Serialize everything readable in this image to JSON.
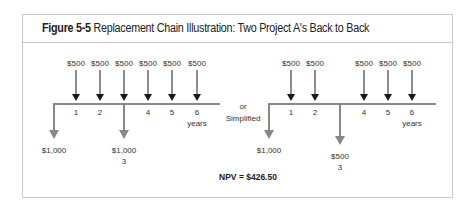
{
  "figure": {
    "label": "Figure 5-5",
    "title": "Replacement Chain Illustration: Two Project A's Back to Back"
  },
  "colors": {
    "inflow_arrow": "#1a1a1a",
    "outflow_arrow": "#888888",
    "timeline": "#888888",
    "border": "#c8c8c8"
  },
  "connector": {
    "line1": "or",
    "line2": "Simplified"
  },
  "left_timeline": {
    "inflows": [
      {
        "year": 1,
        "label": "$500"
      },
      {
        "year": 2,
        "label": "$500"
      },
      {
        "year": 3,
        "label": "$500"
      },
      {
        "year": 4,
        "label": "$500"
      },
      {
        "year": 5,
        "label": "$500"
      },
      {
        "year": 6,
        "label": "$500"
      }
    ],
    "tick_labels": [
      "1",
      "2",
      "",
      "4",
      "5",
      "6"
    ],
    "unit_label": "years",
    "outflows": [
      {
        "year": 0,
        "label": "$1,000",
        "sub": ""
      },
      {
        "year": 3,
        "label": "$1,000",
        "sub": "3"
      }
    ]
  },
  "right_timeline": {
    "inflows": [
      {
        "year": 1,
        "label": "$500"
      },
      {
        "year": 2,
        "label": "$500"
      },
      {
        "year": 4,
        "label": "$500"
      },
      {
        "year": 5,
        "label": "$500"
      },
      {
        "year": 6,
        "label": "$500"
      }
    ],
    "tick_labels": [
      "1",
      "2",
      "",
      "4",
      "5",
      "6"
    ],
    "unit_label": "years",
    "outflows": [
      {
        "year": 0,
        "label": "$1,000",
        "sub": ""
      },
      {
        "year": 3,
        "label": "$500",
        "sub": "3"
      }
    ]
  },
  "npv": "NPV = $426.50"
}
